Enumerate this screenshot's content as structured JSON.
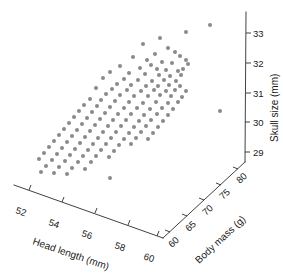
{
  "chart_data": {
    "type": "scatter",
    "projection": "3d",
    "title": "",
    "xlabel": "Head length (mm)",
    "ylabel": "Body mass (g)",
    "zlabel": "Skull size (mm)",
    "xticks": [
      52,
      54,
      56,
      58,
      60
    ],
    "yticks": [
      60,
      65,
      70,
      75,
      80
    ],
    "zticks": [
      29,
      30,
      31,
      32,
      33
    ],
    "xlim": [
      51,
      61
    ],
    "ylim": [
      58,
      82
    ],
    "zlim": [
      28.5,
      33.5
    ],
    "grid": false,
    "legend": null,
    "marker_color": "#8a8a8a",
    "marker_size": 4,
    "axis_color": "#2b2b2b",
    "background": "#ffffff",
    "n_points": 140,
    "points_px": [
      [
        210,
        25
      ],
      [
        186,
        32
      ],
      [
        186,
        60
      ],
      [
        220,
        111
      ],
      [
        160,
        38
      ],
      [
        143,
        44
      ],
      [
        168,
        48
      ],
      [
        175,
        52
      ],
      [
        155,
        54
      ],
      [
        180,
        56
      ],
      [
        133,
        57
      ],
      [
        147,
        60
      ],
      [
        162,
        62
      ],
      [
        172,
        63
      ],
      [
        151,
        65
      ],
      [
        188,
        64
      ],
      [
        120,
        66
      ],
      [
        140,
        68
      ],
      [
        157,
        69
      ],
      [
        166,
        70
      ],
      [
        178,
        71
      ],
      [
        183,
        69
      ],
      [
        110,
        72
      ],
      [
        129,
        73
      ],
      [
        145,
        74
      ],
      [
        159,
        75
      ],
      [
        170,
        76
      ],
      [
        181,
        75
      ],
      [
        103,
        78
      ],
      [
        124,
        79
      ],
      [
        138,
        80
      ],
      [
        152,
        81
      ],
      [
        164,
        80
      ],
      [
        176,
        81
      ],
      [
        117,
        84
      ],
      [
        131,
        85
      ],
      [
        146,
        86
      ],
      [
        158,
        86
      ],
      [
        169,
        85
      ],
      [
        180,
        86
      ],
      [
        96,
        88
      ],
      [
        112,
        89
      ],
      [
        127,
        90
      ],
      [
        141,
        91
      ],
      [
        154,
        90
      ],
      [
        166,
        91
      ],
      [
        175,
        90
      ],
      [
        186,
        91
      ],
      [
        106,
        94
      ],
      [
        120,
        95
      ],
      [
        134,
        96
      ],
      [
        148,
        96
      ],
      [
        160,
        95
      ],
      [
        171,
        96
      ],
      [
        182,
        97
      ],
      [
        90,
        99
      ],
      [
        101,
        100
      ],
      [
        115,
        101
      ],
      [
        129,
        102
      ],
      [
        143,
        103
      ],
      [
        156,
        102
      ],
      [
        168,
        103
      ],
      [
        178,
        102
      ],
      [
        84,
        105
      ],
      [
        97,
        106
      ],
      [
        110,
        107
      ],
      [
        124,
        108
      ],
      [
        137,
        108
      ],
      [
        150,
        109
      ],
      [
        162,
        108
      ],
      [
        173,
        109
      ],
      [
        79,
        111
      ],
      [
        92,
        112
      ],
      [
        105,
        113
      ],
      [
        118,
        114
      ],
      [
        131,
        114
      ],
      [
        144,
        115
      ],
      [
        157,
        114
      ],
      [
        168,
        115
      ],
      [
        74,
        117
      ],
      [
        87,
        118
      ],
      [
        100,
        119
      ],
      [
        113,
        120
      ],
      [
        126,
        120
      ],
      [
        139,
        121
      ],
      [
        151,
        120
      ],
      [
        163,
        121
      ],
      [
        69,
        123
      ],
      [
        82,
        124
      ],
      [
        95,
        125
      ],
      [
        108,
        126
      ],
      [
        121,
        126
      ],
      [
        134,
        127
      ],
      [
        146,
        126
      ],
      [
        158,
        127
      ],
      [
        64,
        129
      ],
      [
        77,
        130
      ],
      [
        90,
        131
      ],
      [
        103,
        132
      ],
      [
        116,
        132
      ],
      [
        129,
        133
      ],
      [
        141,
        132
      ],
      [
        153,
        133
      ],
      [
        59,
        135
      ],
      [
        72,
        136
      ],
      [
        85,
        137
      ],
      [
        98,
        138
      ],
      [
        111,
        138
      ],
      [
        124,
        139
      ],
      [
        136,
        138
      ],
      [
        148,
        139
      ],
      [
        54,
        141
      ],
      [
        67,
        142
      ],
      [
        80,
        143
      ],
      [
        93,
        144
      ],
      [
        106,
        144
      ],
      [
        119,
        145
      ],
      [
        131,
        144
      ],
      [
        49,
        147
      ],
      [
        62,
        148
      ],
      [
        75,
        149
      ],
      [
        88,
        150
      ],
      [
        101,
        150
      ],
      [
        114,
        151
      ],
      [
        44,
        153
      ],
      [
        57,
        154
      ],
      [
        70,
        155
      ],
      [
        83,
        156
      ],
      [
        96,
        156
      ],
      [
        109,
        157
      ],
      [
        39,
        159
      ],
      [
        52,
        160
      ],
      [
        65,
        161
      ],
      [
        78,
        162
      ],
      [
        91,
        162
      ],
      [
        46,
        166
      ],
      [
        59,
        167
      ],
      [
        72,
        168
      ],
      [
        85,
        169
      ],
      [
        41,
        172
      ],
      [
        54,
        173
      ],
      [
        67,
        174
      ],
      [
        110,
        178
      ]
    ]
  },
  "axes": {
    "x": {
      "label": "Head length (mm)",
      "ticks": [
        "52",
        "54",
        "56",
        "58",
        "60"
      ]
    },
    "y": {
      "label": "Body mass (g)",
      "ticks": [
        "60",
        "65",
        "70",
        "75",
        "80"
      ]
    },
    "z": {
      "label": "Skull size (mm)",
      "ticks": [
        "29",
        "30",
        "31",
        "32",
        "33"
      ]
    }
  }
}
